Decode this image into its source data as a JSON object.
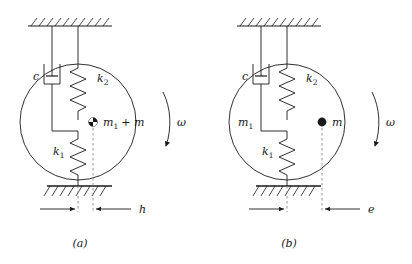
{
  "figure": {
    "background": "#ffffff",
    "stroke": "#1a1a1a",
    "dash_color": "#8a8a8a"
  },
  "panels": [
    {
      "id": "a",
      "caption": "(a)",
      "damper_label": "c",
      "upper_spring_label": "k",
      "upper_spring_sub": "2",
      "lower_spring_label": "k",
      "lower_spring_sub": "1",
      "mass_label": "m",
      "mass_sub": "1",
      "mass_suffix": "+ m",
      "body_label": "",
      "body_sub": "",
      "omega_label": "ω",
      "dimension_label": "h",
      "mass_marker": "quartered-circle-icon"
    },
    {
      "id": "b",
      "caption": "(b)",
      "damper_label": "c",
      "upper_spring_label": "k",
      "upper_spring_sub": "2",
      "lower_spring_label": "k",
      "lower_spring_sub": "1",
      "mass_label": "m",
      "mass_sub": "",
      "mass_suffix": "",
      "body_label": "m",
      "body_sub": "1",
      "omega_label": "ω",
      "dimension_label": "e",
      "mass_marker": "filled-dot-icon"
    }
  ]
}
